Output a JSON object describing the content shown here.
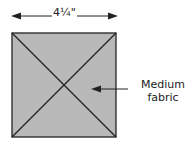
{
  "diagram": {
    "dimension": {
      "label": "4¼\""
    },
    "square": {
      "fill": "#b8b8b8",
      "stroke": "#222222"
    },
    "callout": {
      "line1": "Medium",
      "line2": "fabric"
    }
  }
}
